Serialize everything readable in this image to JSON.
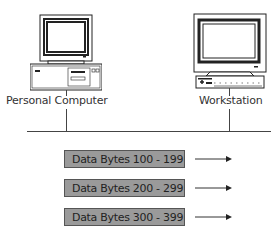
{
  "devices": [
    {
      "id": "pc",
      "label": "Personal Computer",
      "icon": "desktop-computer-icon"
    },
    {
      "id": "ws",
      "label": "Workstation",
      "icon": "workstation-icon"
    }
  ],
  "network": {
    "icon": "network-bus-line"
  },
  "packets": [
    {
      "label": "Data Bytes 100 - 199",
      "direction": "right"
    },
    {
      "label": "Data Bytes 200 - 299",
      "direction": "right"
    },
    {
      "label": "Data Bytes 300 - 399",
      "direction": "right"
    }
  ],
  "colors": {
    "packet_fill": "#9a9a9a",
    "line": "#444444",
    "text": "#333333"
  }
}
